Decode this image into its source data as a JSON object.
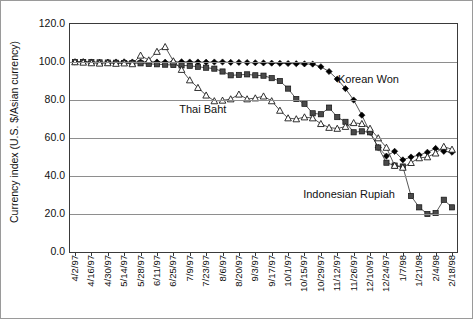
{
  "chart_data": {
    "type": "line",
    "title": "",
    "xlabel": "",
    "ylabel": "Currency index (U.S. $/Asian currency)",
    "ylim": [
      0.0,
      120.0
    ],
    "ytick_labels": [
      "120.0",
      "100.0",
      "80.0",
      "60.0",
      "40.0",
      "20.0",
      "0.0"
    ],
    "ytick_values": [
      120.0,
      100.0,
      80.0,
      60.0,
      40.0,
      20.0,
      0.0
    ],
    "grid": true,
    "legend_position": "inline-annotations",
    "categories": [
      "4/2/97",
      "4/9/97",
      "4/16/97",
      "4/23/97",
      "4/30/97",
      "5/7/97",
      "5/14/97",
      "5/21/97",
      "5/28/97",
      "6/4/97",
      "6/11/97",
      "6/18/97",
      "6/25/97",
      "7/2/97",
      "7/9/97",
      "7/16/97",
      "7/23/97",
      "7/30/97",
      "8/6/97",
      "8/13/97",
      "8/20/97",
      "8/27/97",
      "9/3/97",
      "9/10/97",
      "9/17/97",
      "9/24/97",
      "10/1/97",
      "10/8/97",
      "10/15/97",
      "10/22/97",
      "10/29/97",
      "11/5/97",
      "11/12/97",
      "11/19/97",
      "11/26/97",
      "12/3/97",
      "12/10/97",
      "12/17/97",
      "12/24/97",
      "12/31/97",
      "1/7/98",
      "1/14/98",
      "1/21/98",
      "1/28/98",
      "2/4/98",
      "2/11/98",
      "2/18/98"
    ],
    "xtick_labels": [
      "4/2/97",
      "4/16/97",
      "4/30/97",
      "5/14/97",
      "5/28/97",
      "6/11/97",
      "6/25/97",
      "7/9/97",
      "7/23/97",
      "8/6/97",
      "8/20/97",
      "9/3/97",
      "9/17/97",
      "10/1/97",
      "10/15/97",
      "10/29/97",
      "11/12/97",
      "11/26/97",
      "12/10/97",
      "12/24/97",
      "1/7/98",
      "1/21/98",
      "2/4/98",
      "2/18/98"
    ],
    "series": [
      {
        "name": "Korean Won",
        "marker": "filled-diamond",
        "color": "#000000",
        "values": [
          100.0,
          100.2,
          100.0,
          99.8,
          99.9,
          100.0,
          100.1,
          100.0,
          100.0,
          100.2,
          100.0,
          99.9,
          100.0,
          100.1,
          100.0,
          100.0,
          99.9,
          100.0,
          100.0,
          99.8,
          99.8,
          99.7,
          99.6,
          99.5,
          99.4,
          99.3,
          99.2,
          99.1,
          99.0,
          98.9,
          97.5,
          95.0,
          91.0,
          86.0,
          80.0,
          72.0,
          63.0,
          55.0,
          50.5,
          53.0,
          48.5,
          50.0,
          51.0,
          52.5,
          54.5,
          53.0,
          52.5
        ]
      },
      {
        "name": "Indonesian Rupiah",
        "marker": "filled-square",
        "color": "#4a4a4a",
        "values": [
          100.0,
          100.0,
          99.9,
          99.8,
          99.7,
          99.6,
          99.5,
          99.4,
          99.3,
          99.0,
          98.8,
          98.6,
          98.4,
          98.2,
          98.0,
          97.5,
          97.0,
          96.5,
          95.0,
          93.0,
          93.2,
          93.5,
          93.0,
          92.8,
          91.5,
          90.0,
          86.0,
          80.5,
          78.0,
          73.0,
          72.5,
          76.0,
          71.0,
          68.5,
          63.0,
          63.5,
          63.0,
          55.0,
          47.0,
          45.5,
          45.0,
          29.5,
          23.5,
          20.0,
          20.5,
          27.5,
          23.5
        ]
      },
      {
        "name": "Thai Baht",
        "marker": "open-triangle",
        "color": "#1a1a1a",
        "values": [
          100.0,
          99.8,
          99.5,
          99.3,
          99.5,
          99.2,
          99.4,
          99.0,
          103.5,
          101.0,
          105.5,
          108.0,
          100.5,
          96.0,
          90.5,
          86.5,
          82.5,
          79.5,
          79.8,
          80.5,
          83.0,
          80.5,
          81.0,
          82.0,
          79.5,
          74.5,
          70.5,
          70.0,
          71.0,
          70.5,
          67.5,
          65.5,
          65.0,
          66.0,
          68.0,
          67.5,
          65.0,
          60.0,
          55.0,
          45.5,
          44.5,
          47.0,
          49.5,
          50.0,
          52.0,
          55.5,
          54.0
        ]
      }
    ],
    "annotations": [
      {
        "text": "Korean Won",
        "x_frac": 0.695,
        "y_value": 90.0
      },
      {
        "text": "Thai Baht",
        "x_frac": 0.285,
        "y_value": 74.0
      },
      {
        "text": "Indonesian Rupiah",
        "x_frac": 0.605,
        "y_value": 29.5
      }
    ]
  }
}
